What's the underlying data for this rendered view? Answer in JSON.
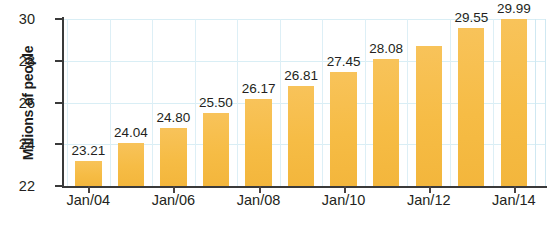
{
  "chart_data": {
    "type": "bar",
    "title": "",
    "xlabel": "",
    "ylabel": "Millions of people",
    "ylim": [
      22,
      30
    ],
    "yticks": [
      22,
      24,
      26,
      28,
      30
    ],
    "grid": true,
    "legend": "none",
    "categories": [
      "Jan/04",
      "Jan/05",
      "Jan/06",
      "Jan/07",
      "Jan/08",
      "Jan/09",
      "Jan/10",
      "Jan/11",
      "Jan/12",
      "Jan/13",
      "Jan/14"
    ],
    "values": [
      23.21,
      24.04,
      24.8,
      25.5,
      26.17,
      26.81,
      27.45,
      28.08,
      28.7,
      29.55,
      29.99
    ],
    "bar_labels": [
      "23.21",
      "24.04",
      "24.80",
      "25.50",
      "26.17",
      "26.81",
      "27.45",
      "28.08",
      "",
      "29.55",
      "29.99"
    ],
    "xtick_labels": [
      "Jan/04",
      "Jan/06",
      "Jan/08",
      "Jan/10",
      "Jan/12",
      "Jan/14"
    ],
    "xtick_indices": [
      0,
      2,
      4,
      6,
      8,
      10
    ],
    "bar_color": "#f7bf4f",
    "grid_color": "#d9eef5",
    "axis_color": "#3a3a3a",
    "text_color": "#231f20"
  }
}
